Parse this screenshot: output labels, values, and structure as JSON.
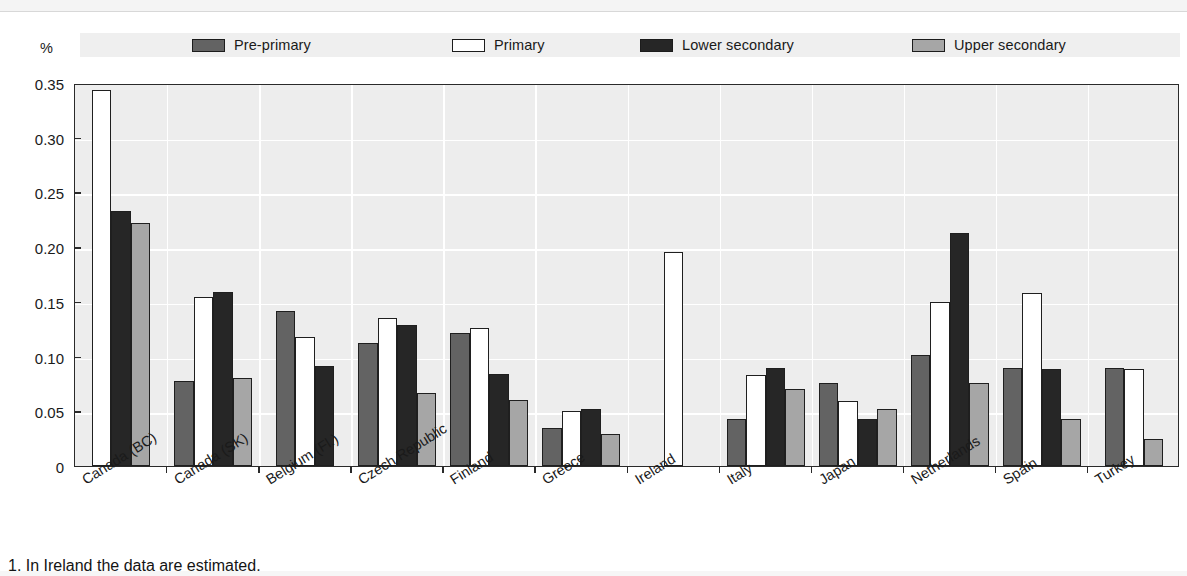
{
  "figure": {
    "y_axis_unit_label": "%",
    "footnote": "1. In Ireland the data are estimated."
  },
  "legend": {
    "items": [
      {
        "label": "Pre-primary",
        "color": "#636363",
        "x": 112
      },
      {
        "label": "Primary",
        "color": "#ffffff",
        "x": 372
      },
      {
        "label": "Lower secondary",
        "color": "#262626",
        "x": 560
      },
      {
        "label": "Upper secondary",
        "color": "#a6a6a6",
        "x": 832
      }
    ]
  },
  "chart_data": {
    "type": "bar",
    "title": "",
    "xlabel": "",
    "ylabel": "%",
    "ylim": [
      0,
      0.35
    ],
    "yticks": [
      "0",
      "0.05",
      "0.10",
      "0.15",
      "0.20",
      "0.25",
      "0.30",
      "0.35"
    ],
    "ytick_values": [
      0,
      0.05,
      0.1,
      0.15,
      0.2,
      0.25,
      0.3,
      0.35
    ],
    "grid": true,
    "legend_position": "top",
    "categories": [
      "Canada (BC)",
      "Canada (SK)",
      "Belgium (Fl.)",
      "Czech Republic",
      "Finland",
      "Greece",
      "Ireland",
      "Italy",
      "Japan",
      "Netherlands",
      "Spain",
      "Turkey"
    ],
    "series": [
      {
        "name": "Pre-primary",
        "color": "#636363",
        "values": [
          null,
          0.078,
          0.142,
          0.112,
          0.122,
          0.035,
          null,
          0.043,
          0.076,
          0.101,
          0.09,
          0.09
        ]
      },
      {
        "name": "Primary",
        "color": "#ffffff",
        "values": [
          0.344,
          0.154,
          0.118,
          0.135,
          0.126,
          0.05,
          0.196,
          0.083,
          0.059,
          0.15,
          0.158,
          0.089
        ]
      },
      {
        "name": "Lower secondary",
        "color": "#262626",
        "values": [
          0.233,
          0.159,
          0.091,
          0.129,
          0.084,
          0.052,
          null,
          0.09,
          0.043,
          0.213,
          0.089,
          null
        ]
      },
      {
        "name": "Upper secondary",
        "color": "#a6a6a6",
        "values": [
          0.222,
          0.08,
          null,
          0.067,
          0.06,
          0.029,
          null,
          0.07,
          0.052,
          0.076,
          0.043,
          0.025
        ]
      }
    ]
  }
}
